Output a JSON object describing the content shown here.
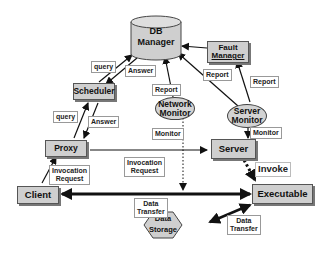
{
  "diagram": {
    "nodes": {
      "db_manager": {
        "line1": "DB",
        "line2": "Manager"
      },
      "fault_manager": {
        "line1": "Fault",
        "line2": "Manager"
      },
      "scheduler": "Scheduler",
      "network_monitor": {
        "line1": "Network",
        "line2": "Monitor"
      },
      "server_monitor": {
        "line1": "Server",
        "line2": "Monitor"
      },
      "proxy": "Proxy",
      "server": "Server",
      "client": "Client",
      "executable": "Executable",
      "data_storage": {
        "line1": "Data",
        "line2": "Storage"
      }
    },
    "edge_labels": {
      "query_top": "query",
      "answer_top": "Answer",
      "query_bottom": "query",
      "answer_bottom": "Answer",
      "report_network": "Report",
      "report_server_db": "Report",
      "report_fault": "Report",
      "monitor_network": "Monitor",
      "monitor_server": "Monitor",
      "invocation_client": {
        "line1": "Invocation",
        "line2": "Request"
      },
      "invocation_proxy": {
        "line1": "Invocation",
        "line2": "Request"
      },
      "invoke": "Invoke",
      "data_transfer_main": {
        "line1": "Data",
        "line2": "Transfer"
      },
      "data_transfer_storage": {
        "line1": "Data",
        "line2": "Transfer"
      }
    },
    "colors": {
      "node_fill": "#cfcfcf",
      "line": "#111111",
      "label_bg": "#ffffff"
    }
  }
}
